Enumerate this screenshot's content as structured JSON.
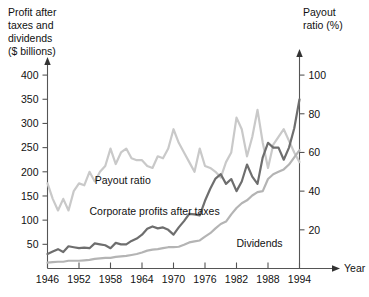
{
  "chart_data": {
    "type": "line",
    "title": "",
    "xlabel": "Year",
    "left_axis_title": "Profit after taxes and dividends ($ billions)",
    "left_axis_title_lines": [
      "Profit after",
      "taxes and",
      "dividends",
      "($ billions)"
    ],
    "right_axis_title": "Payout ratio (%)",
    "right_axis_title_lines": [
      "Payout",
      "ratio (%)"
    ],
    "x": [
      1946,
      1947,
      1948,
      1949,
      1950,
      1951,
      1952,
      1953,
      1954,
      1955,
      1956,
      1957,
      1958,
      1959,
      1960,
      1961,
      1962,
      1963,
      1964,
      1965,
      1966,
      1967,
      1968,
      1969,
      1970,
      1971,
      1972,
      1973,
      1974,
      1975,
      1976,
      1977,
      1978,
      1979,
      1980,
      1981,
      1982,
      1983,
      1984,
      1985,
      1986,
      1987,
      1988,
      1989,
      1990,
      1991,
      1992,
      1993,
      1994
    ],
    "xlim": [
      1946,
      1994
    ],
    "xticks": [
      1946,
      1952,
      1958,
      1964,
      1970,
      1976,
      1982,
      1988,
      1994
    ],
    "xtick_labels": [
      "1946",
      "1952",
      "1958",
      "1964",
      "1970",
      "1976",
      "1982",
      "1988",
      "1994"
    ],
    "ylim_left": [
      0,
      425
    ],
    "yticks_left": [
      50,
      100,
      150,
      200,
      250,
      300,
      350,
      400
    ],
    "ytick_labels_left": [
      "50",
      "100",
      "150",
      "200",
      "250",
      "300",
      "350",
      "400"
    ],
    "ylim_right": [
      0,
      106.25
    ],
    "yticks_right": [
      20,
      40,
      60,
      80,
      100
    ],
    "ytick_labels_right": [
      "20",
      "40",
      "60",
      "80",
      "100"
    ],
    "grid": false,
    "legend_position": "inline-annotations",
    "series": [
      {
        "name": "Payout ratio",
        "axis": "right",
        "color": "#c9c9c9",
        "label_x": 1955,
        "label_y_left": 175,
        "values": [
          44,
          36,
          30,
          36,
          30,
          40,
          44,
          43,
          50,
          45,
          50,
          53,
          62,
          54,
          60,
          62,
          57,
          56,
          56,
          53,
          52,
          58,
          57,
          62,
          72,
          65,
          60,
          55,
          50,
          62,
          53,
          52,
          50,
          47,
          55,
          60,
          78,
          72,
          58,
          68,
          82,
          65,
          52,
          64,
          68,
          72,
          66,
          60,
          55
        ]
      },
      {
        "name": "Corporate profits after taxes",
        "axis": "left",
        "color": "#6e6e6e",
        "label_x": 1954,
        "label_y_left": 110,
        "values": [
          30,
          35,
          40,
          34,
          46,
          44,
          42,
          43,
          42,
          52,
          50,
          48,
          42,
          53,
          50,
          50,
          57,
          62,
          70,
          82,
          87,
          83,
          85,
          80,
          70,
          85,
          98,
          113,
          112,
          110,
          140,
          165,
          186,
          195,
          175,
          185,
          160,
          180,
          215,
          190,
          175,
          230,
          260,
          250,
          250,
          225,
          250,
          290,
          350
        ]
      },
      {
        "name": "Dividends",
        "axis": "left",
        "color": "#b4b4b4",
        "label_x": 1982,
        "label_y_left": 45,
        "values": [
          12,
          13,
          14,
          14,
          16,
          16,
          16,
          17,
          18,
          20,
          21,
          22,
          22,
          24,
          25,
          26,
          28,
          30,
          33,
          37,
          39,
          40,
          42,
          44,
          44,
          45,
          49,
          54,
          56,
          58,
          66,
          73,
          83,
          92,
          97,
          112,
          125,
          135,
          141,
          151,
          158,
          160,
          185,
          195,
          200,
          205,
          215,
          230,
          245
        ]
      }
    ]
  }
}
